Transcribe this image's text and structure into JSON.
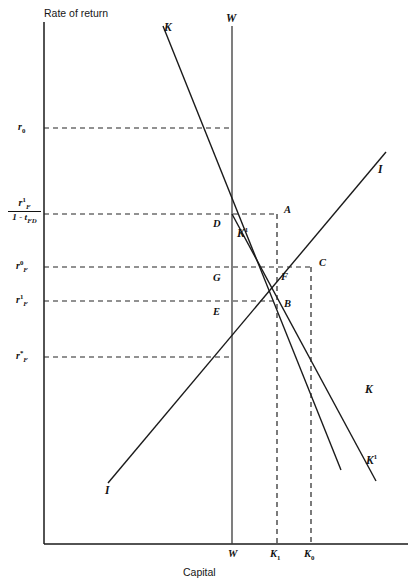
{
  "figure": {
    "axes": {
      "y_title": "Rate of return",
      "x_title": "Capital"
    },
    "y_ticks": [
      {
        "name": "r0",
        "label_html": "r0",
        "base": "r",
        "sub": "0",
        "sup": "",
        "y": 128
      },
      {
        "name": "rF1_over_1_minus_tFD",
        "numerator": "r",
        "num_sup": "1",
        "num_sub": "F",
        "denominator": "1 - t",
        "den_sub": "FD",
        "y": 214
      },
      {
        "name": "rF0",
        "base": "r",
        "sub": "F",
        "sup": "0",
        "y": 267
      },
      {
        "name": "rF1",
        "base": "r",
        "sub": "F",
        "sup": "1",
        "y": 301
      },
      {
        "name": "rFstar",
        "base": "r",
        "sub": "F",
        "sup": "*",
        "y": 357
      }
    ],
    "x_ticks": [
      {
        "name": "W",
        "label": "W",
        "sub": "",
        "x": 232
      },
      {
        "name": "K1",
        "label": "K",
        "sub": "1",
        "x": 277
      },
      {
        "name": "K0",
        "label": "K",
        "sub": "0",
        "x": 311
      }
    ],
    "curve_labels": [
      {
        "name": "K-top",
        "label": "K",
        "sup": "",
        "x": 164,
        "y": 21
      },
      {
        "name": "W-top",
        "label": "W",
        "sup": "",
        "x": 226,
        "y": 13
      },
      {
        "name": "K1-inner",
        "label": "K",
        "sup": "1",
        "x": 237,
        "y": 226
      },
      {
        "name": "I-right",
        "label": "I",
        "sup": "",
        "x": 378,
        "y": 165
      },
      {
        "name": "K-right",
        "label": "K",
        "sup": "",
        "x": 365,
        "y": 385
      },
      {
        "name": "K1-right",
        "label": "K",
        "sup": "1",
        "x": 368,
        "y": 455
      },
      {
        "name": "I-left",
        "label": "I",
        "sup": "",
        "x": 105,
        "y": 487
      }
    ],
    "point_labels": [
      {
        "name": "A",
        "label": "A",
        "x": 284,
        "y": 205
      },
      {
        "name": "D",
        "label": "D",
        "x": 214,
        "y": 219
      },
      {
        "name": "C",
        "label": "C",
        "x": 319,
        "y": 258
      },
      {
        "name": "F",
        "label": "F",
        "x": 281,
        "y": 272
      },
      {
        "name": "G",
        "label": "G",
        "x": 214,
        "y": 273
      },
      {
        "name": "B",
        "label": "B",
        "x": 284,
        "y": 299
      },
      {
        "name": "E",
        "label": "E",
        "x": 214,
        "y": 307
      }
    ],
    "geometry": {
      "origin": {
        "x": 44,
        "y": 544
      },
      "axis_top": {
        "y": 22
      },
      "axis_right": {
        "x": 408
      },
      "w_line": {
        "x": 232,
        "y_top": 26,
        "y_bottom": 544
      },
      "lines": [
        {
          "name": "K-curve",
          "x1": 163,
          "y1": 26,
          "x2": 341,
          "y2": 470
        },
        {
          "name": "I-curve",
          "x1": 108,
          "y1": 483,
          "x2": 386,
          "y2": 152
        },
        {
          "name": "K1-curve",
          "x1": 232,
          "y1": 214,
          "x2": 376,
          "y2": 481
        }
      ],
      "dashed_horizontals": [
        {
          "name": "r0-guide",
          "y": 128,
          "x1": 44,
          "x2": 232
        },
        {
          "name": "frac-guide",
          "y": 214,
          "x1": 44,
          "x2": 277
        },
        {
          "name": "rF0-guide",
          "y": 267,
          "x1": 44,
          "x2": 311
        },
        {
          "name": "rF1-guide",
          "y": 301,
          "x1": 44,
          "x2": 277
        },
        {
          "name": "rFstar-guide",
          "y": 357,
          "x1": 44,
          "x2": 232
        }
      ],
      "dashed_verticals": [
        {
          "name": "K1-guide",
          "x": 277,
          "y1": 214,
          "y2": 544
        },
        {
          "name": "K0-guide",
          "x": 311,
          "y1": 267,
          "y2": 544
        }
      ]
    },
    "colors": {
      "line": "#1a1a1a",
      "axis": "#1a1a1a",
      "dash": "#242424",
      "background": "#ffffff"
    }
  }
}
